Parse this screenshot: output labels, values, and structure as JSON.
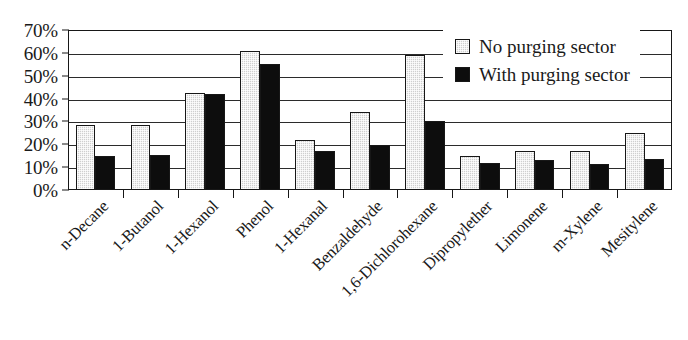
{
  "chart_data": {
    "type": "bar",
    "title": "",
    "subtitle": "",
    "xlabel": "",
    "ylabel": "",
    "ylim": [
      0,
      70
    ],
    "ytick_labels": [
      "0%",
      "10%",
      "20%",
      "30%",
      "40%",
      "50%",
      "60%",
      "70%"
    ],
    "ytick_values": [
      0,
      10,
      20,
      30,
      40,
      50,
      60,
      70
    ],
    "grid": true,
    "legend_position": "top-right",
    "categories": [
      "n-Decane",
      "1-Butanol",
      "1-Hexanol",
      "Phenol",
      "1-Hexanal",
      "Benzaldehyde",
      "1,6-Dichlorohexane",
      "Dipropylether",
      "Limonene",
      "m-Xylene",
      "Mesitylene"
    ],
    "series": [
      {
        "name": "No purging sector",
        "color": "#cfcfcf",
        "values": [
          28.5,
          28.5,
          42.5,
          61,
          22,
          34,
          59,
          15,
          17,
          17,
          25
        ]
      },
      {
        "name": "With purging sector",
        "color": "#0d0d0d",
        "values": [
          15,
          15.5,
          42,
          55,
          17,
          19.5,
          30,
          12,
          13,
          11.5,
          13.5
        ]
      }
    ]
  },
  "legend": {
    "items": [
      {
        "label": "No purging sector",
        "swatch": "light-square-icon"
      },
      {
        "label": "With purging sector",
        "swatch": "dark-square-icon"
      }
    ]
  }
}
